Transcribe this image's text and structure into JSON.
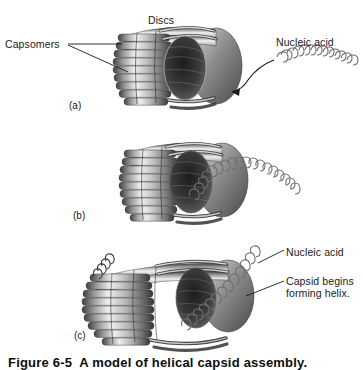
{
  "figure": {
    "caption": "Figure 6-5  A model of helical capsid assembly.",
    "background_color": "#ffffff",
    "ink_color": "#1a1a1a"
  },
  "labels": {
    "capsomers": "Capsomers",
    "discs": "Discs",
    "nucleic_acid_a": "Nucleic acid",
    "nucleic_acid_c": "Nucleic acid",
    "capsid_forming": "Capsid begins\nforming helix."
  },
  "panels": [
    {
      "id": "a",
      "label": "(a)",
      "description": "Stack of capsomer discs with hollow center; nucleic acid approaching from the right",
      "callouts": [
        "Capsomers",
        "Discs",
        "Nucleic acid"
      ]
    },
    {
      "id": "b",
      "label": "(b)",
      "description": "Nucleic acid inserted through the central hole of the disc stack",
      "callouts": []
    },
    {
      "id": "c",
      "label": "(c)",
      "description": "Capsid elongating into a helix around the nucleic acid",
      "callouts": [
        "Nucleic acid",
        "Capsid begins forming helix."
      ]
    }
  ],
  "colors": {
    "capsomer_light": "#f2f2f2",
    "capsomer_mid": "#9a9a9a",
    "capsomer_dark": "#4a4a4a",
    "capsomer_shadow": "#2e2e2e",
    "nucleic_acid": "#6b6b6b",
    "leader_line": "#1a1a1a"
  }
}
